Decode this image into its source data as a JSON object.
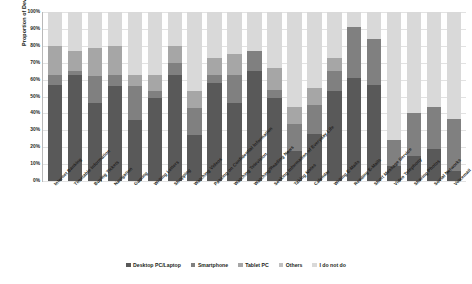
{
  "chart_data": {
    "type": "bar",
    "subtype": "stacked-bar-100-percent",
    "title": "",
    "xlabel": "",
    "ylabel": "Proportion of Device Used",
    "ylim": [
      0,
      100
    ],
    "grid": true,
    "legend_position": "bottom",
    "ytick_labels": [
      "100%",
      "90%",
      "80%",
      "70%",
      "60%",
      "50%",
      "40%",
      "30%",
      "20%",
      "10%",
      "0%"
    ],
    "ytick_values": [
      100,
      90,
      80,
      70,
      60,
      50,
      40,
      30,
      20,
      10,
      0
    ],
    "categories": [
      "Internet Banking",
      "Timetable Information",
      "Buying Tickets",
      "Navigation",
      "Gaming",
      "Writing Letters",
      "Shopping",
      "Watching Videos",
      "Passing on Confidential Information",
      "Watching Television",
      "Watching/Reading News",
      "Seeking Information of Everyday Life",
      "Taking Notes",
      "Calendar",
      "Writing E-Mails",
      "Reading E-Mails",
      "Short Message Service",
      "Video Telephony",
      "Sharing Photos",
      "Social Networks",
      "Voicemail"
    ],
    "series": [
      {
        "name": "Desktop PC/Laptop",
        "color": "#595959",
        "values": [
          57,
          63,
          46,
          56,
          36,
          49,
          63,
          27,
          58,
          46,
          65,
          49,
          18,
          28,
          53,
          61,
          57,
          9,
          15,
          19,
          6
        ]
      },
      {
        "name": "Smartphone",
        "color": "#808080",
        "values": [
          6,
          2,
          16,
          7,
          20,
          4,
          7,
          16,
          5,
          17,
          12,
          5,
          16,
          17,
          12,
          30,
          27,
          15,
          25,
          25,
          31
        ]
      },
      {
        "name": "Tablet PC",
        "color": "#a6a6a6",
        "values": [
          17,
          12,
          17,
          17,
          7,
          10,
          10,
          10,
          10,
          12,
          0,
          13,
          10,
          10,
          8,
          0,
          0,
          0,
          0,
          0,
          0
        ]
      },
      {
        "name": "Others",
        "color": "#bfbfbf",
        "values": [
          0,
          0,
          0,
          0,
          0,
          0,
          0,
          0,
          0,
          0,
          0,
          0,
          0,
          0,
          0,
          0,
          0,
          0,
          0,
          0,
          0
        ]
      },
      {
        "name": "I do not do",
        "color": "#d9d9d9",
        "values": [
          20,
          23,
          21,
          20,
          37,
          37,
          20,
          47,
          27,
          25,
          23,
          33,
          56,
          45,
          27,
          9,
          16,
          76,
          60,
          56,
          63
        ]
      }
    ]
  },
  "legend": {
    "items": [
      {
        "label": "Desktop PC/Laptop",
        "color": "#595959"
      },
      {
        "label": "Smartphone",
        "color": "#808080"
      },
      {
        "label": "Tablet PC",
        "color": "#a6a6a6"
      },
      {
        "label": "Others",
        "color": "#bfbfbf"
      },
      {
        "label": "I do not do",
        "color": "#d9d9d9"
      }
    ]
  }
}
